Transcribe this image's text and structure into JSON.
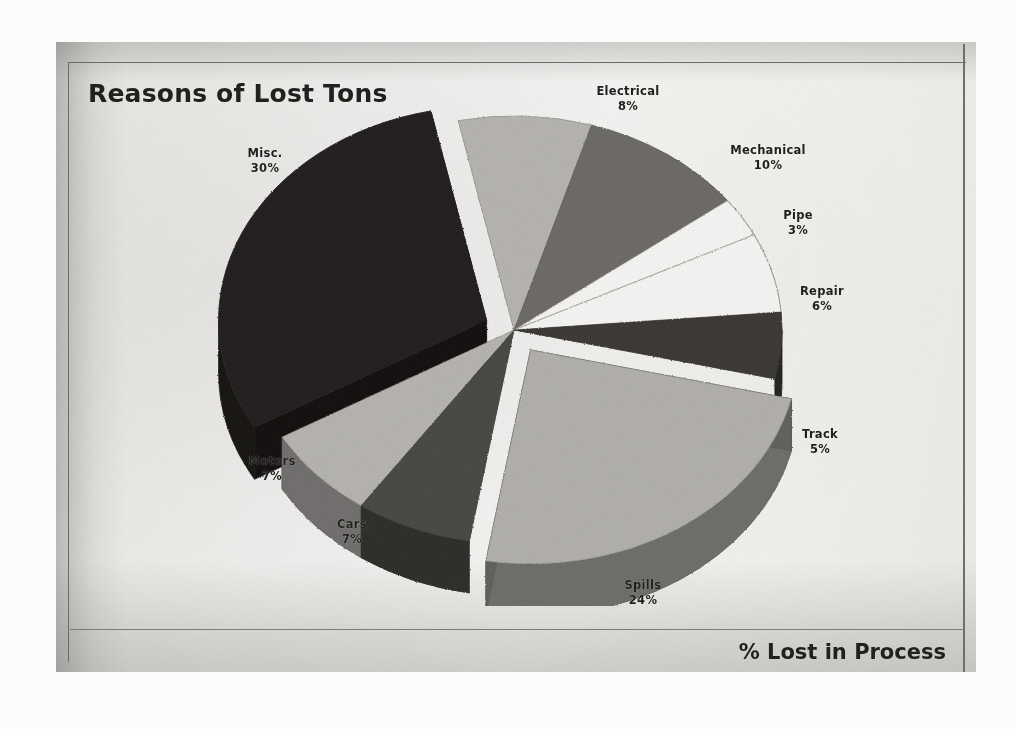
{
  "document": {
    "kind": "scanned-chart-page",
    "page_background": "#ffffff",
    "sheet_background": "#efeeec"
  },
  "chart_title": "Reasons of Lost Tons",
  "axis_caption": "% Lost in Process",
  "chart_data": {
    "type": "pie",
    "title": "Reasons of Lost Tons",
    "xlabel": "% Lost in Process",
    "ylabel": "",
    "style": "3d-exploded-pie",
    "units": "percent",
    "total": 100,
    "legend": "none-labels-outside",
    "categories": [
      "Electrical",
      "Mechanical",
      "Pipe",
      "Repair",
      "Track",
      "Spills",
      "Cars",
      "Motors",
      "Misc."
    ],
    "values": [
      8,
      10,
      3,
      6,
      5,
      24,
      7,
      7,
      30
    ],
    "slices": [
      {
        "label": "Electrical",
        "value": 8,
        "pct_text": "8%",
        "color": "#b9b7b3",
        "exploded": false
      },
      {
        "label": "Mechanical",
        "value": 10,
        "pct_text": "10%",
        "color": "#6e6c68",
        "exploded": false
      },
      {
        "label": "Pipe",
        "value": 3,
        "pct_text": "3%",
        "color": "#fbfaf8",
        "exploded": false
      },
      {
        "label": "Repair",
        "value": 6,
        "pct_text": "6%",
        "color": "#fbfaf8",
        "exploded": false
      },
      {
        "label": "Track",
        "value": 5,
        "pct_text": "5%",
        "color": "#3a3835",
        "exploded": false
      },
      {
        "label": "Spills",
        "value": 24,
        "pct_text": "24%",
        "color": "#b5b3af",
        "exploded": true
      },
      {
        "label": "Cars",
        "value": 7,
        "pct_text": "7%",
        "color": "#4a4845",
        "exploded": false
      },
      {
        "label": "Motors",
        "value": 7,
        "pct_text": "7%",
        "color": "#b9b7b3",
        "exploded": false
      },
      {
        "label": "Misc.",
        "value": 30,
        "pct_text": "30%",
        "color": "#211f1d",
        "exploded": true
      }
    ]
  },
  "labels": {
    "electrical": {
      "name": "Electrical",
      "pct": "8%"
    },
    "mechanical": {
      "name": "Mechanical",
      "pct": "10%"
    },
    "pipe": {
      "name": "Pipe",
      "pct": "3%"
    },
    "repair": {
      "name": "Repair",
      "pct": "6%"
    },
    "track": {
      "name": "Track",
      "pct": "5%"
    },
    "spills": {
      "name": "Spills",
      "pct": "24%"
    },
    "cars": {
      "name": "Cars",
      "pct": "7%"
    },
    "motors": {
      "name": "Motors",
      "pct": "7%"
    },
    "misc": {
      "name": "Misc.",
      "pct": "30%"
    }
  },
  "colors": {
    "ink": "#1d1c1a",
    "frame": "#6a6864",
    "sheet": "#efeeec",
    "slice_black": "#211f1d",
    "slice_dark": "#3a3835",
    "slice_mid": "#6e6c68",
    "slice_light": "#b9b7b3",
    "slice_white": "#fbfaf8"
  }
}
